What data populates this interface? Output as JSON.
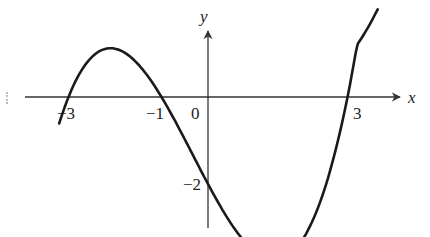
{
  "figure": {
    "type": "cubic function graph",
    "axes": {
      "x_label": "x",
      "y_label": "y",
      "origin_label": "0"
    },
    "x_tick_labels": [
      "−3",
      "−1",
      "3"
    ],
    "y_tick_labels": [
      "−2"
    ],
    "colors": {
      "curve": "#1a1a1a",
      "axis": "#333333",
      "background": "#ffffff"
    }
  },
  "chart_data": {
    "type": "line",
    "title": "",
    "xlabel": "x",
    "ylabel": "y",
    "x_intercepts": [
      -3,
      -1,
      3
    ],
    "y_intercept": -2,
    "function": "y = (2/9)(x+3)(x+1)(x-3)",
    "x": [
      -3.2,
      -3,
      -2.5,
      -2,
      -1.5,
      -1,
      -0.5,
      0,
      0.5,
      1,
      1.5,
      2,
      2.5,
      3,
      3.5
    ],
    "series": [
      {
        "name": "curve",
        "values": [
          -1.6,
          0,
          0.83,
          1.11,
          0.75,
          0,
          -0.86,
          -2,
          -2.64,
          -3.56,
          -3.75,
          -3.33,
          -2.14,
          0,
          2.17
        ]
      }
    ],
    "xlim": [
      -4.2,
      4.3
    ],
    "ylim": [
      -3.3,
      2.1
    ],
    "grid": false,
    "legend": "none"
  }
}
